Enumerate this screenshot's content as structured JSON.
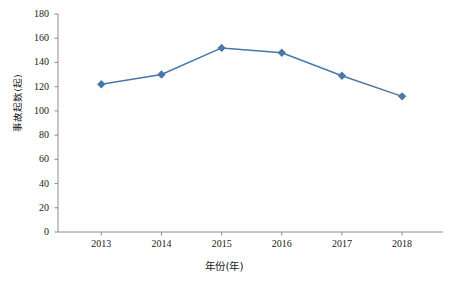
{
  "chart_data": {
    "type": "line",
    "title": "",
    "subtitle": "",
    "xlabel": "年份(年)",
    "ylabel": "事故起数(起)",
    "categories": [
      "2013",
      "2014",
      "2015",
      "2016",
      "2017",
      "2018"
    ],
    "values": [
      122,
      130,
      152,
      148,
      129,
      112
    ],
    "series": [
      {
        "name": "事故起数",
        "values": [
          122,
          130,
          152,
          148,
          129,
          112
        ]
      }
    ],
    "x": [
      2013,
      2014,
      2015,
      2016,
      2017,
      2018
    ],
    "xlim": [
      2012.5,
      2018.5
    ],
    "ylim": [
      0,
      180
    ],
    "ytick_labels": [
      "0",
      "20",
      "40",
      "60",
      "80",
      "100",
      "120",
      "140",
      "160",
      "180"
    ],
    "ytick_values": [
      0,
      20,
      40,
      60,
      80,
      100,
      120,
      140,
      160,
      180
    ],
    "xtick_labels": [
      "2013",
      "2014",
      "2015",
      "2016",
      "2017",
      "2018"
    ],
    "grid": false,
    "legend": false,
    "legend_position": "none",
    "marker": "diamond",
    "series_color": "#4a77a8",
    "axis_color": "#8c8c8c",
    "text_color": "#1a1a1a",
    "background": "#ffffff",
    "annotations": []
  }
}
